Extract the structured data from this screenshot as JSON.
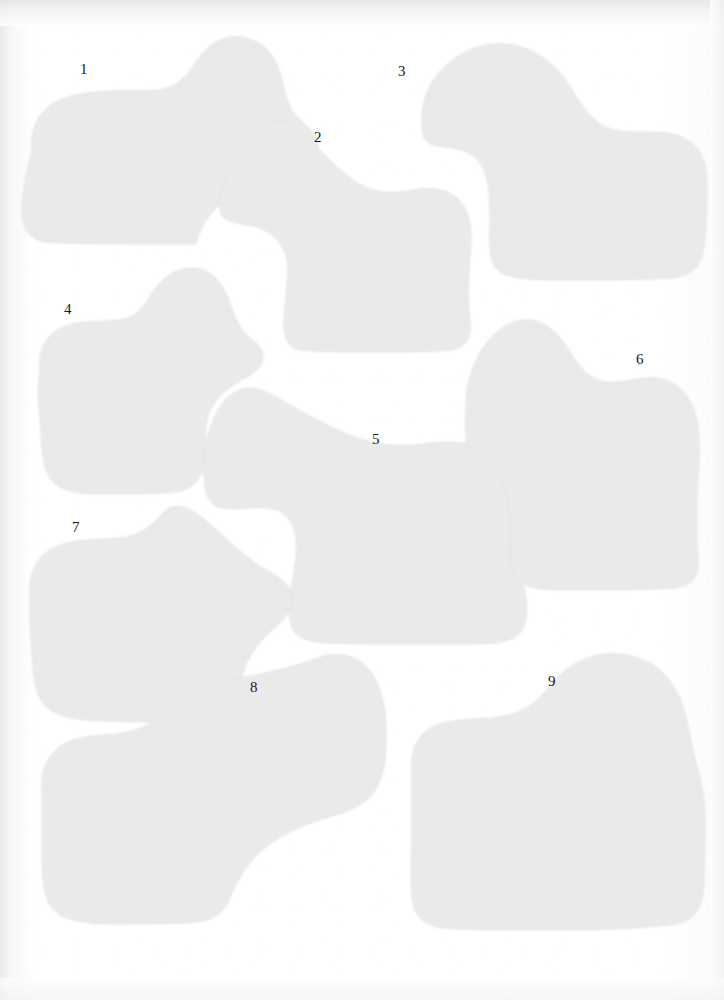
{
  "plate": {
    "kind": "scanned-plate-of-outline-shapes",
    "background_color": "#ffffff",
    "paper_tint": "#fdfdfd",
    "shape_fill_color": "#eaeaea",
    "shape_edge_color": "#e2e2e2",
    "label_color": "#171717",
    "shape_count": 9
  },
  "shapes": [
    {
      "label": "1",
      "label_x": 80,
      "label_y": 62,
      "path": "M32 150 C30 121, 44 103, 72 96 C104 88, 134 92, 158 90 C176 88, 186 78, 196 62 C208 44, 224 33, 246 38 C268 43, 278 62, 282 80 C286 98, 290 112, 300 120 C312 130, 322 140, 316 152 C310 164, 296 168, 280 172 C258 178, 236 188, 218 206 C204 220, 198 234, 196 244 L186 244 C172 244, 156 244, 140 244 C112 244, 70 244, 46 242 C30 240, 22 228, 22 212 C22 196, 26 172, 32 150 Z"
    },
    {
      "label": "2",
      "label_x": 314,
      "label_y": 130,
      "path": "M222 216 C216 200, 222 180, 234 164 C246 148, 258 134, 266 126 C276 116, 290 120, 304 134 C320 150, 338 170, 356 182 C374 194, 394 194, 414 190 C434 186, 452 190, 462 204 C472 218, 472 236, 470 256 C468 280, 468 304, 470 322 C472 338, 466 348, 450 350 C430 352, 404 352, 376 352 C346 352, 316 352, 300 350 C288 348, 284 338, 284 324 C284 306, 288 286, 288 270 C288 252, 280 238, 264 230 C248 222, 232 226, 222 216 Z"
    },
    {
      "label": "3",
      "label_x": 398,
      "label_y": 64,
      "path": "M422 126 C420 102, 430 78, 450 62 C470 46, 494 40, 518 46 C542 52, 560 70, 572 90 C584 110, 596 126, 614 130 C632 134, 654 130, 672 134 C692 138, 704 152, 706 172 C708 194, 706 222, 704 246 C702 266, 692 276, 672 278 C648 280, 600 280, 560 280 C524 280, 504 278, 496 268 C488 258, 490 240, 490 218 C490 192, 488 172, 478 160 C468 148, 450 148, 438 146 C426 144, 422 138, 422 126 Z"
    },
    {
      "label": "4",
      "label_x": 64,
      "label_y": 302,
      "path": "M40 368 C38 348, 48 332, 66 326 C84 320, 104 322, 120 320 C134 318, 142 310, 150 296 C160 280, 174 268, 192 268 C210 268, 222 282, 228 298 C234 314, 238 328, 248 336 C258 344, 266 352, 262 362 C258 372, 248 376, 238 382 C224 390, 212 402, 208 416 C204 430, 206 446, 204 462 C202 480, 192 490, 174 492 C154 494, 124 494, 100 494 C74 494, 58 490, 50 478 C42 466, 42 444, 40 420 C38 400, 38 384, 40 368 Z"
    },
    {
      "label": "5",
      "label_x": 372,
      "label_y": 432,
      "path": "M204 470 C204 446, 210 420, 222 404 C234 388, 250 384, 266 392 C286 402, 314 420, 342 432 C368 444, 396 448, 424 444 C450 440, 476 442, 496 454 C514 466, 522 486, 522 508 C522 532, 518 558, 522 578 C526 598, 530 618, 522 630 C514 642, 496 644, 474 644 C448 644, 412 644, 378 644 C344 644, 316 644, 302 638 C290 632, 288 618, 290 600 C292 580, 298 558, 296 540 C294 520, 284 510, 268 508 C250 506, 230 512, 216 506 C206 500, 204 486, 204 470 Z"
    },
    {
      "label": "6",
      "label_x": 636,
      "label_y": 352,
      "path": "M466 404 C466 382, 474 360, 486 344 C498 328, 514 318, 530 320 C548 322, 560 336, 570 352 C580 368, 590 380, 606 382 C622 384, 640 376, 656 378 C674 380, 688 392, 694 410 C700 428, 700 452, 698 476 C696 504, 696 536, 698 558 C700 576, 692 586, 674 588 C650 590, 604 590, 566 590 C536 590, 520 586, 514 576 C508 566, 510 548, 510 528 C510 502, 506 484, 496 474 C486 464, 472 462, 468 448 C464 434, 466 418, 466 404 Z"
    },
    {
      "label": "7",
      "label_x": 72,
      "label_y": 520,
      "path": "M30 594 C28 572, 38 554, 58 546 C78 538, 102 540, 120 538 C138 536, 150 528, 162 514 C176 498, 194 510, 212 526 C230 542, 248 560, 266 570 C282 578, 294 588, 292 602 C290 616, 278 624, 266 636 C252 650, 244 664, 242 678 C240 692, 240 704, 232 712 C224 720, 208 722, 186 722 C160 722, 118 722, 88 720 C60 718, 44 710, 38 694 C32 678, 32 650, 30 622 C30 610, 30 600, 30 594 Z"
    },
    {
      "label": "8",
      "label_x": 250,
      "label_y": 680,
      "path": "M42 790 C40 768, 50 750, 68 742 C86 734, 110 736, 128 732 C146 728, 160 718, 176 706 C194 692, 214 682, 238 678 C266 674, 296 666, 318 658 C340 650, 360 656, 372 674 C384 692, 386 714, 386 736 C386 758, 384 778, 374 792 C364 806, 346 812, 326 818 C300 826, 276 836, 258 854 C242 870, 234 888, 228 902 C222 914, 212 920, 196 922 C176 924, 142 924, 116 924 C84 924, 62 920, 52 908 C42 896, 42 870, 42 842 C42 820, 42 802, 42 790 Z"
    },
    {
      "label": "9",
      "label_x": 548,
      "label_y": 674,
      "path": "M412 770 C410 748, 420 730, 440 724 C460 718, 486 720, 506 716 C524 712, 538 702, 550 686 C564 668, 584 656, 606 654 C628 652, 652 660, 666 676 C680 692, 686 714, 690 736 C694 760, 702 780, 704 802 C706 826, 704 856, 704 880 C704 906, 696 920, 676 924 C652 928, 600 930, 552 930 C508 930, 468 930, 444 928 C424 926, 414 916, 412 898 C410 876, 412 844, 412 812 C412 794, 412 780, 412 770 Z"
    }
  ]
}
